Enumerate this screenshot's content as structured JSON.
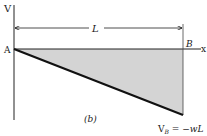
{
  "diagram": {
    "figure_label": "(b)",
    "axes": {
      "vertical_label": "V",
      "horizontal_label": "x"
    },
    "points": {
      "start": "A",
      "end": "B"
    },
    "dimension": {
      "label": "L"
    },
    "annotation": {
      "v_symbol": "V",
      "v_subscript": "B",
      "equals": " = −",
      "expression": "wL"
    },
    "colors": {
      "fill": "#d4d4d4",
      "line": "#111111"
    }
  }
}
